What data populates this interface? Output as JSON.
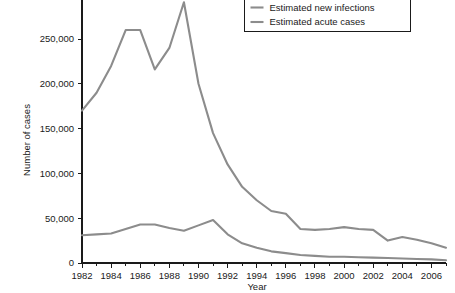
{
  "chart_data": {
    "type": "line",
    "title": "",
    "xlabel": "Year",
    "ylabel": "Number of cases",
    "xlim": [
      1982,
      2007
    ],
    "ylim": [
      0,
      300000
    ],
    "grid": false,
    "legend_position": "top-right",
    "x_ticks": [
      1982,
      1984,
      1986,
      1988,
      1990,
      1992,
      1994,
      1996,
      1998,
      2000,
      2002,
      2004,
      2006
    ],
    "x_tick_labels": [
      "1982",
      "1984",
      "1986",
      "1988",
      "1990",
      "1992",
      "1994",
      "1996",
      "1998",
      "2000",
      "2002",
      "2004",
      "2006"
    ],
    "x_minor_ticks": [
      1983,
      1985,
      1987,
      1989,
      1991,
      1993,
      1995,
      1997,
      1999,
      2001,
      2003,
      2005,
      2007
    ],
    "y_ticks": [
      0,
      50000,
      100000,
      150000,
      200000,
      250000,
      300000
    ],
    "y_tick_labels": [
      "0",
      "50,000",
      "100,000",
      "150,000",
      "200,000",
      "250,000",
      "300,000"
    ],
    "x": [
      1982,
      1983,
      1984,
      1985,
      1986,
      1987,
      1988,
      1989,
      1990,
      1991,
      1992,
      1993,
      1994,
      1995,
      1996,
      1997,
      1998,
      1999,
      2000,
      2001,
      2002,
      2003,
      2004,
      2005,
      2006,
      2007
    ],
    "series": [
      {
        "name": "Estimated new infections",
        "color": "#8c8c8c",
        "values": [
          170000,
          190000,
          220000,
          260000,
          260000,
          216000,
          240000,
          291000,
          200000,
          145000,
          110000,
          85000,
          70000,
          58000,
          55000,
          38000,
          37000,
          38000,
          40000,
          38000,
          37000,
          25000,
          29000,
          26000,
          22000,
          17000
        ]
      },
      {
        "name": "Estimated acute cases",
        "color": "#8c8c8c",
        "values": [
          31000,
          32000,
          33000,
          38000,
          43000,
          43000,
          39000,
          36000,
          42000,
          48000,
          32000,
          22000,
          17000,
          13000,
          11000,
          9000,
          8000,
          7000,
          7000,
          6500,
          6000,
          5500,
          5000,
          4500,
          4000,
          3000
        ]
      }
    ]
  },
  "axes": {
    "x_title": "Year",
    "y_title": "Number of cases"
  },
  "legend": {
    "items": [
      {
        "label": "Estimated new infections",
        "swatch_color": "#8c8c8c"
      },
      {
        "label": "Estimated acute cases",
        "swatch_color": "#8c8c8c"
      }
    ]
  }
}
